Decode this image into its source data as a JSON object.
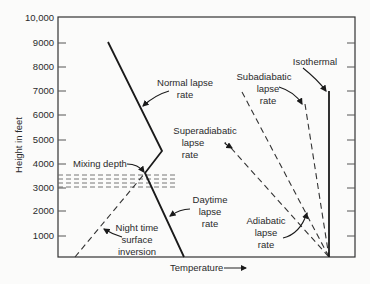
{
  "diagram": {
    "y_axis": {
      "label": "Height in feet",
      "ticks": [
        "10,000",
        "9000",
        "8000",
        "7000",
        "6000",
        "5000",
        "4000",
        "3000",
        "2000",
        "1000"
      ]
    },
    "x_axis": {
      "label": "Temperature",
      "arrow": "→"
    },
    "labels": {
      "normal_lapse": [
        "Normal lapse",
        "rate"
      ],
      "isothermal": "Isothermal",
      "subadiabatic": [
        "Subadiabatic",
        "lapse",
        "rate"
      ],
      "superadiabatic": [
        "Superadiabatic",
        "lapse",
        "rate"
      ],
      "mixing_depth": "Mixing depth",
      "daytime_lapse": [
        "Daytime",
        "lapse",
        "rate"
      ],
      "adiabatic": [
        "Adiabatic",
        "lapse",
        "rate"
      ],
      "night_inversion": [
        "Night time",
        "surface",
        "inversion"
      ]
    },
    "colors": {
      "line": "#1a1a1a",
      "frame": "#333333",
      "dash": "#333333"
    }
  }
}
